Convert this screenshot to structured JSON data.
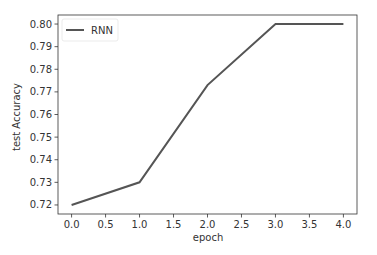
{
  "chart_data": {
    "type": "line",
    "title": "",
    "xlabel": "epoch",
    "ylabel": "test Accuracy",
    "x": [
      0,
      1,
      2,
      3,
      4
    ],
    "series": [
      {
        "name": "RNN",
        "values": [
          0.72,
          0.73,
          0.773,
          0.8,
          0.8
        ],
        "color": "#555555"
      }
    ],
    "xticks": [
      "0.0",
      "0.5",
      "1.0",
      "1.5",
      "2.0",
      "2.5",
      "3.0",
      "3.5",
      "4.0"
    ],
    "yticks": [
      "0.72",
      "0.73",
      "0.74",
      "0.75",
      "0.76",
      "0.77",
      "0.78",
      "0.79",
      "0.80"
    ],
    "xlim": [
      -0.2,
      4.2
    ],
    "ylim": [
      0.716,
      0.804
    ],
    "grid": false,
    "legend_position": "upper left"
  }
}
